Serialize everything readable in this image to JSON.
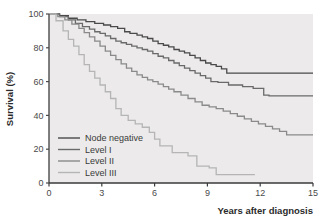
{
  "chart_data": {
    "type": "line",
    "title": "",
    "subtitle": "",
    "xlabel": "Years after diagnosis",
    "ylabel": "Survival (%)",
    "xlim": [
      0,
      15
    ],
    "ylim": [
      0,
      100
    ],
    "xticks": [
      0,
      3,
      6,
      9,
      12,
      15
    ],
    "yticks": [
      0,
      20,
      40,
      60,
      80,
      100
    ],
    "xtick_labels": [
      "0",
      "3",
      "6",
      "9",
      "12",
      "15"
    ],
    "ytick_labels": [
      "0",
      "20",
      "40",
      "60",
      "80",
      "100"
    ],
    "grid": false,
    "legend_position": "lower-left",
    "plot_background": "#eceaea",
    "step_style": "post",
    "series": [
      {
        "name": "Node negative",
        "color": "#4a4a4a",
        "x": [
          0,
          0.6,
          1.1,
          1.6,
          2.1,
          2.6,
          3.1,
          3.5,
          3.9,
          4.3,
          4.6,
          5.0,
          5.3,
          5.6,
          5.9,
          6.2,
          6.5,
          6.8,
          7.1,
          7.4,
          7.7,
          8.0,
          8.3,
          8.6,
          8.9,
          9.2,
          9.5,
          9.8,
          10.1,
          15.0
        ],
        "y": [
          100,
          99,
          97.5,
          96.5,
          95.5,
          94.5,
          93.5,
          92.5,
          91.5,
          89.5,
          88.5,
          87.5,
          86.5,
          85.5,
          84.0,
          82.5,
          81.5,
          80.5,
          79.0,
          78.0,
          77.0,
          75.5,
          74.0,
          72.5,
          71.0,
          70.0,
          69.0,
          67.5,
          65.0,
          65.0
        ]
      },
      {
        "name": "Level I",
        "color": "#6a6a6a",
        "x": [
          0,
          0.6,
          1.1,
          1.5,
          1.9,
          2.3,
          2.6,
          2.9,
          3.2,
          3.5,
          3.8,
          4.1,
          4.4,
          4.7,
          5.0,
          5.3,
          5.6,
          5.9,
          6.2,
          6.5,
          6.8,
          7.1,
          7.4,
          7.7,
          8.0,
          8.3,
          8.6,
          8.9,
          9.2,
          9.6,
          10.2,
          11.0,
          11.6,
          12.2,
          12.5,
          15.0
        ],
        "y": [
          100,
          98.5,
          96.5,
          94.5,
          92.5,
          91.0,
          89.5,
          88.5,
          87.0,
          85.5,
          84.0,
          83.0,
          82.0,
          81.0,
          80.0,
          79.0,
          78.0,
          76.5,
          75.0,
          74.0,
          72.5,
          71.0,
          69.5,
          68.0,
          66.5,
          65.0,
          63.5,
          62.0,
          60.0,
          59.5,
          58.0,
          57.0,
          56.0,
          52.0,
          51.5,
          51.5
        ]
      },
      {
        "name": "Level II",
        "color": "#8a8a8a",
        "x": [
          0,
          0.5,
          0.9,
          1.3,
          1.7,
          2.0,
          2.3,
          2.6,
          2.9,
          3.2,
          3.5,
          3.8,
          4.1,
          4.4,
          4.7,
          5.0,
          5.3,
          5.6,
          5.9,
          6.2,
          6.5,
          6.8,
          7.1,
          7.5,
          7.9,
          8.3,
          8.7,
          9.1,
          9.5,
          9.9,
          10.3,
          10.7,
          11.1,
          11.5,
          11.9,
          12.3,
          12.7,
          13.1,
          13.5,
          15.0
        ],
        "y": [
          100,
          98.5,
          96.5,
          94.0,
          91.5,
          89.0,
          86.5,
          84.0,
          81.0,
          78.0,
          75.5,
          73.0,
          70.5,
          68.0,
          66.0,
          64.0,
          62.5,
          61.0,
          60.0,
          58.5,
          57.0,
          55.5,
          54.0,
          52.0,
          50.0,
          48.0,
          46.0,
          45.0,
          44.0,
          42.5,
          41.0,
          39.5,
          38.0,
          36.5,
          35.0,
          33.5,
          32.0,
          30.5,
          28.5,
          28.5
        ]
      },
      {
        "name": "Level III",
        "color": "#b5b5b5",
        "x": [
          0,
          0.4,
          0.8,
          1.1,
          1.4,
          1.7,
          2.0,
          2.3,
          2.6,
          2.9,
          3.2,
          3.5,
          3.8,
          4.1,
          4.5,
          4.9,
          5.3,
          5.7,
          6.0,
          6.3,
          7.0,
          7.6,
          7.9,
          8.4,
          9.1,
          9.5,
          11.7
        ],
        "y": [
          100,
          96.0,
          90.0,
          85.0,
          81.0,
          76.0,
          70.0,
          66.0,
          62.0,
          58.0,
          54.0,
          50.0,
          44.0,
          40.0,
          37.0,
          35.0,
          33.0,
          30.0,
          26.0,
          22.0,
          18.0,
          18.0,
          16.0,
          10.0,
          9.0,
          5.0,
          5.0
        ]
      }
    ]
  },
  "legend": {
    "items": [
      {
        "label": "Node negative",
        "color": "#4a4a4a"
      },
      {
        "label": "Level I",
        "color": "#6a6a6a"
      },
      {
        "label": "Level II",
        "color": "#8a8a8a"
      },
      {
        "label": "Level III",
        "color": "#b5b5b5"
      }
    ]
  }
}
